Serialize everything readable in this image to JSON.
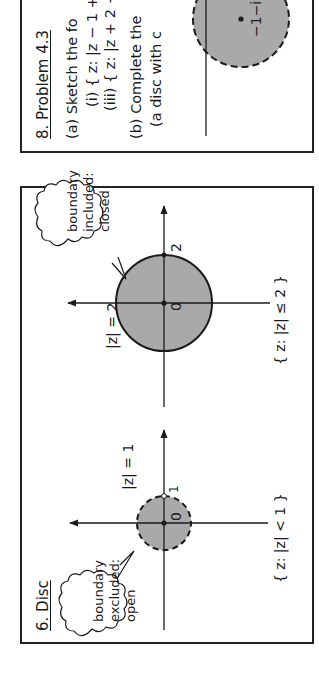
{
  "disc_panel": {
    "title": "6. Disc",
    "open_disc": {
      "radius_label": "|z| = 1",
      "tick_label": "1",
      "origin_label": "0",
      "set_label": "{ z: |z| < 1 }",
      "callout_lines": [
        "boundary",
        "excluded:",
        "open"
      ],
      "boundary_style": "dashed"
    },
    "closed_disc": {
      "radius_label": "|z| = 2",
      "tick_label": "2",
      "origin_label": "0",
      "set_label": "{ z: |z| ≤ 2 }",
      "callout_lines": [
        "boundary",
        "included:",
        "closed"
      ],
      "boundary_style": "solid"
    }
  },
  "problem_panel": {
    "title": "8. Problem 4.3",
    "lines": [
      "(a) Sketch the fo",
      "(i) { z: |z − 1 +",
      "(iii) { z: |z + 2 −",
      "(b) Complete the",
      "(a disc with c"
    ],
    "disc_center_label": "−1−i"
  },
  "colors": {
    "disc_fill": "#a9a9a9",
    "ink": "#1a1a1a",
    "background": "#ffffff"
  }
}
